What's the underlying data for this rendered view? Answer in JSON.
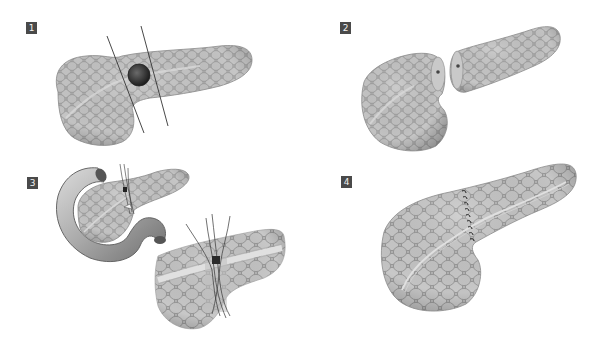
{
  "figure": {
    "panels": [
      {
        "step": "1",
        "description": "Pancreas with lesion in neck/body; two transection lines marked on either side of the tumor"
      },
      {
        "step": "2",
        "description": "Central segment resected; pancreatic head and body/tail separated with duct openings visible"
      },
      {
        "step": "3",
        "description": "Pancreas with duodenum; duct-to-duct anastomosis with stent and sutures, magnified inset"
      },
      {
        "step": "4",
        "description": "Completed end-to-end pancreatic anastomosis with suture line across the gland"
      }
    ]
  },
  "colors": {
    "badge_bg": "#4a4a4a",
    "badge_text": "#f2f2f2",
    "tissue": "#b8b8b8",
    "tissue_dark": "#8c8c8c",
    "lobule_edge": "#9a9a9a",
    "lesion": "#3a3a3a",
    "line": "#333333"
  }
}
